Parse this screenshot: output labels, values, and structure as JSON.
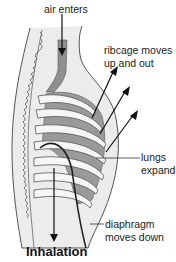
{
  "diagram": {
    "title": "Inhalation",
    "labels": {
      "air": "air enters",
      "ribcage_line1": "ribcage moves",
      "ribcage_line2": "up and out",
      "lungs_line1": "lungs",
      "lungs_line2": "expand",
      "diaphragm_line1": "diaphragm",
      "diaphragm_line2": "moves down"
    },
    "colors": {
      "body_fill": "#ececec",
      "outline": "#555555",
      "lung_fill": "#9a9a9a",
      "trachea_fill": "#8f8f8f",
      "rib_fill": "#f6f6f6",
      "arrow": "#111111",
      "diaphragm": "#222222"
    }
  }
}
